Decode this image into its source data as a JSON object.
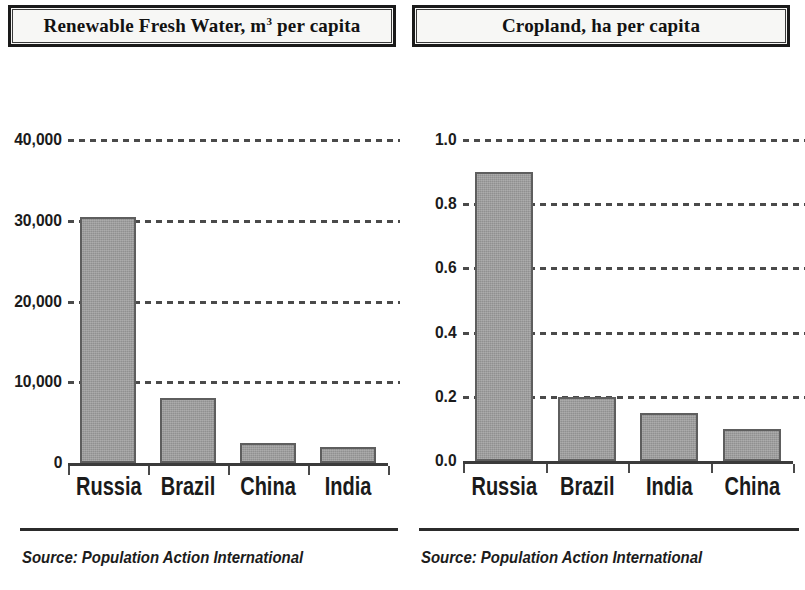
{
  "panels": [
    {
      "title_main": "Renewable Fresh Water, m",
      "title_sup": "3",
      "title_tail": " per capita",
      "source": "Source: Population Action International",
      "chart_data": {
        "type": "bar",
        "title": "Renewable Fresh Water, m3 per capita",
        "xlabel": "",
        "ylabel": "",
        "categories": [
          "Russia",
          "Brazil",
          "China",
          "India"
        ],
        "values": [
          30500,
          8000,
          2500,
          2000
        ],
        "ylim": [
          0,
          40000
        ],
        "yticks": [
          0,
          10000,
          20000,
          30000,
          40000
        ],
        "ytick_labels": [
          "0",
          "10,000",
          "20,000",
          "30,000",
          "40,000"
        ],
        "grid": true,
        "legend": "none",
        "bar_color": "#9b9b9b",
        "bar_edge_color": "#5e5e5e"
      }
    },
    {
      "title_main": "Cropland, ha per capita",
      "title_sup": "",
      "title_tail": "",
      "source": "Source: Population Action International",
      "chart_data": {
        "type": "bar",
        "title": "Cropland, ha per capita",
        "xlabel": "",
        "ylabel": "",
        "categories": [
          "Russia",
          "Brazil",
          "India",
          "China"
        ],
        "values": [
          0.9,
          0.2,
          0.15,
          0.1
        ],
        "ylim": [
          0,
          1.0
        ],
        "yticks": [
          0,
          0.2,
          0.4,
          0.6,
          0.8,
          1.0
        ],
        "ytick_labels": [
          "0.0",
          "0.2",
          "0.4",
          "0.6",
          "0.8",
          "1.0"
        ],
        "grid": true,
        "legend": "none",
        "bar_color": "#9b9b9b",
        "bar_edge_color": "#5e5e5e"
      }
    }
  ]
}
